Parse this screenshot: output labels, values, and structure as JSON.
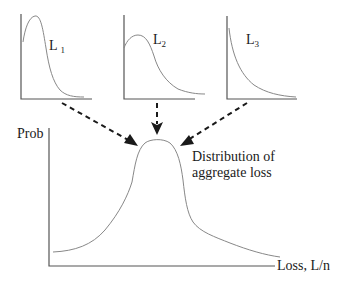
{
  "small_plots": [
    {
      "label": "L",
      "subscript": "1",
      "shape": "right-skewed narrow peak"
    },
    {
      "label": "L",
      "subscript": "2",
      "shape": "right-skewed broad peak"
    },
    {
      "label": "L",
      "subscript": "3",
      "shape": "exponential decay"
    }
  ],
  "main_plot": {
    "y_label": "Prob",
    "x_label": "Loss, L/n",
    "curve_label_line1": "Distribution of",
    "curve_label_line2": "aggregate loss"
  },
  "colors": {
    "axis": "#555555",
    "curve": "#888888",
    "arrow": "#1a1a1a",
    "text": "#1a1a1a"
  }
}
